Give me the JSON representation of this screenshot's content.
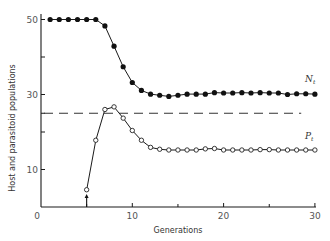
{
  "chart_data": {
    "type": "line",
    "title": "",
    "xlabel": "Generations",
    "ylabel": "Host and parasitoid populations",
    "xlim": [
      0,
      30
    ],
    "ylim": [
      0,
      52
    ],
    "x_ticks_labeled": [
      0,
      10,
      20,
      30
    ],
    "x_ticks_minor": [
      5,
      15,
      25
    ],
    "y_ticks_labeled": [
      10,
      30,
      50
    ],
    "y_ticks_minor": [
      20,
      25,
      40
    ],
    "grid": false,
    "series": [
      {
        "name": "N_t",
        "label_main": "N",
        "label_sub": "t",
        "marker": "filled-circle",
        "x": [
          1,
          2,
          3,
          4,
          5,
          6,
          7,
          8,
          9,
          10,
          11,
          12,
          13,
          14,
          15,
          16,
          17,
          18,
          19,
          20,
          21,
          22,
          23,
          24,
          25,
          26,
          27,
          28,
          29,
          30
        ],
        "values": [
          50,
          50,
          50,
          50,
          50,
          50,
          48.3,
          42.9,
          37.4,
          33.2,
          31.1,
          30.1,
          29.8,
          29.5,
          29.8,
          30.1,
          30.1,
          30.1,
          30.5,
          30.4,
          30.4,
          30.5,
          30.4,
          30.5,
          30.4,
          30.4,
          30.0,
          30.2,
          30.2,
          30.1
        ]
      },
      {
        "name": "P_t",
        "label_main": "P",
        "label_sub": "t",
        "marker": "open-circle",
        "x": [
          5,
          6,
          7,
          8,
          9,
          10,
          11,
          12,
          13,
          14,
          15,
          16,
          17,
          18,
          19,
          20,
          21,
          22,
          23,
          24,
          25,
          26,
          27,
          28,
          29,
          30
        ],
        "values": [
          4.6,
          17.8,
          26.0,
          26.7,
          23.7,
          20.4,
          17.8,
          15.9,
          15.4,
          15.2,
          15.2,
          15.2,
          15.2,
          15.5,
          15.6,
          15.2,
          15.2,
          15.2,
          15.2,
          15.3,
          15.3,
          15.2,
          15.2,
          15.2,
          15.2,
          15.2
        ]
      }
    ],
    "reference_lines": [
      {
        "type": "horizontal-dashed",
        "y": 25,
        "x_start": 0,
        "x_end": 28.5
      }
    ],
    "annotations": [
      {
        "type": "arrow-up",
        "x": 5,
        "y_from": 0,
        "y_to": 3.5,
        "meaning": "parasitoid introduction"
      }
    ]
  }
}
